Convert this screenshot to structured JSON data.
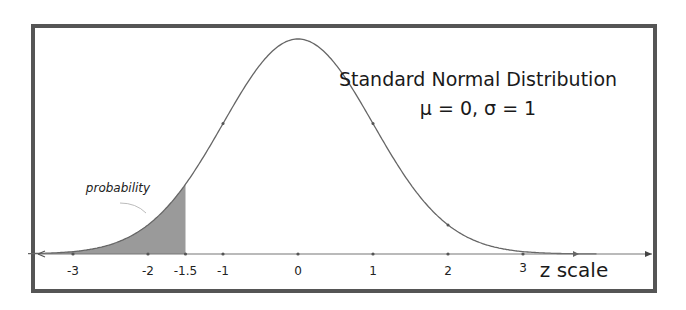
{
  "chart_data": {
    "type": "area",
    "title": "Standard Normal Distribution",
    "subtitle": "μ = 0, σ = 1",
    "xlabel": "z scale",
    "ylabel": "",
    "x_ticks": [
      -3,
      -2,
      -1.5,
      -1,
      0,
      1,
      2,
      3
    ],
    "x_tick_labels": [
      "-3",
      "-2",
      "-1.5",
      "-1",
      "0",
      "1",
      "2",
      "3"
    ],
    "xlim": [
      -3.5,
      4.7
    ],
    "distribution": {
      "mean": 0,
      "sd": 1
    },
    "shaded_region": {
      "from": "-inf",
      "to": -1.5,
      "label": "probability"
    },
    "grid": false,
    "legend": null
  },
  "colors": {
    "curve": "#666666",
    "shade": "#9a9a9a",
    "frame": "#555555",
    "axis": "#777777"
  }
}
